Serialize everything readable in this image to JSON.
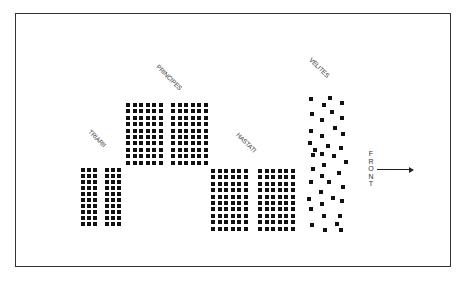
{
  "diagram": {
    "title": "",
    "front_label": "FRONT",
    "units": [
      {
        "name": "TRIARII",
        "blocks": 2,
        "cols": 3,
        "rows": 10
      },
      {
        "name": "PRINCIPES",
        "blocks": 2,
        "cols": 6,
        "rows": 10
      },
      {
        "name": "HASTATI",
        "blocks": 2,
        "cols": 6,
        "rows": 10
      },
      {
        "name": "VELITES",
        "formation": "scattered skirmishers"
      }
    ],
    "colors": {
      "marker": "#111111",
      "border": "#333333",
      "background": "#ffffff"
    }
  }
}
